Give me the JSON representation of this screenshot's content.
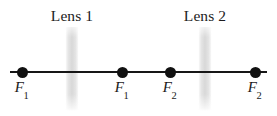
{
  "figure": {
    "type": "optics-ray-diagram",
    "background_color": "#ffffff",
    "width": 277,
    "height": 116
  },
  "axis": {
    "name": "optical-axis",
    "color": "#161616",
    "x_start": 10,
    "x_end": 267,
    "y": 72
  },
  "lenses": [
    {
      "label": "Lens 1",
      "x": 72,
      "color": "#c9c9c9"
    },
    {
      "label": "Lens 2",
      "x": 205,
      "color": "#c9c9c9"
    }
  ],
  "focal_points": [
    {
      "symbol": "F",
      "subscript": "1",
      "x": 22,
      "dot_color": "#111111"
    },
    {
      "symbol": "F",
      "subscript": "1",
      "x": 122,
      "dot_color": "#111111"
    },
    {
      "symbol": "F",
      "subscript": "2",
      "x": 170,
      "dot_color": "#111111"
    },
    {
      "symbol": "F",
      "subscript": "2",
      "x": 255,
      "dot_color": "#111111"
    }
  ]
}
